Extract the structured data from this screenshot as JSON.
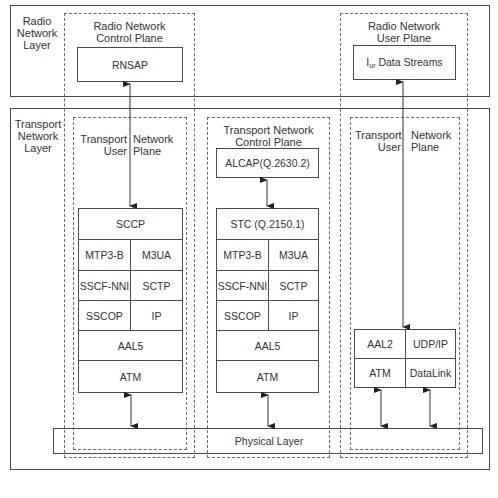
{
  "layers": {
    "radio": {
      "label_line1": "Radio",
      "label_line2": "Network",
      "label_line3": "Layer"
    },
    "transport": {
      "label_line1": "Transport",
      "label_line2": "Network",
      "label_line3": "Layer"
    }
  },
  "planes": {
    "radio_control": {
      "line1": "Radio Network",
      "line2": "Control Plane",
      "protocol": "RNSAP"
    },
    "radio_user": {
      "line1": "Radio Network",
      "line2": "User Plane",
      "protocol_main": "I",
      "protocol_sub": "ur",
      "protocol_rest": " Data Streams"
    },
    "transport_user_left": {
      "left1": "Transport",
      "left2": "User",
      "right1": "Network",
      "right2": "Plane"
    },
    "transport_control": {
      "line1": "Transport Network",
      "line2": "Control Plane"
    },
    "transport_user_right": {
      "left1": "Transport",
      "left2": "User",
      "right1": "Network",
      "right2": "Plane"
    }
  },
  "stacks": {
    "left": {
      "top": "SCCP",
      "pairs": [
        [
          "MTP3-B",
          "M3UA"
        ],
        [
          "SSCF-NNI",
          "SCTP"
        ],
        [
          "SSCOP",
          "IP"
        ]
      ],
      "bottom": [
        "AAL5",
        "ATM"
      ]
    },
    "middle": {
      "alcap": "ALCAP(Q.2630.2)",
      "top": "STC (Q.2150.1)",
      "pairs": [
        [
          "MTP3-B",
          "M3UA"
        ],
        [
          "SSCF-NNI",
          "SCTP"
        ],
        [
          "SSCOP",
          "IP"
        ]
      ],
      "bottom": [
        "AAL5",
        "ATM"
      ]
    },
    "right": {
      "pairs": [
        [
          "AAL2",
          "UDP/IP"
        ],
        [
          "ATM",
          "DataLink"
        ]
      ]
    }
  },
  "physical_layer": "Physical Layer",
  "colors": {
    "line": "#4a4a4a",
    "dashed": "#6a6a6a",
    "text": "#333333"
  }
}
